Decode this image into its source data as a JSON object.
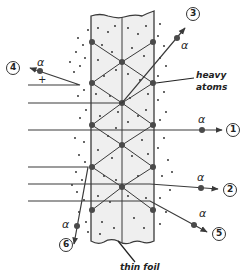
{
  "diagram": {
    "labels": {
      "heavy_atoms_line1": "heavy",
      "heavy_atoms_line2": "atoms",
      "thin_foil": "thin foil",
      "alpha": "α",
      "plus": "+"
    },
    "paths": [
      {
        "id": "1",
        "label": "1",
        "description": "passes straight through"
      },
      {
        "id": "2",
        "label": "2",
        "description": "slightly deflected"
      },
      {
        "id": "3",
        "label": "3",
        "description": "deflected upward"
      },
      {
        "id": "4",
        "label": "4",
        "description": "reflected back"
      },
      {
        "id": "5",
        "label": "5",
        "description": "deflected downward"
      },
      {
        "id": "6",
        "label": "6",
        "description": "deflected sharply downward"
      }
    ],
    "colors": {
      "line": "#3a3a3a",
      "atom": "#4a4a4a",
      "foil_fill": "#efefef",
      "dots": "#222222"
    }
  }
}
